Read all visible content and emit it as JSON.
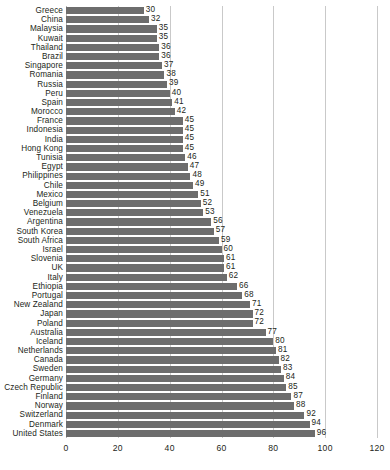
{
  "chart_data": {
    "type": "bar",
    "orientation": "horizontal",
    "title": "",
    "subtitle": "",
    "xlabel": "",
    "ylabel": "",
    "xlim": [
      0,
      120
    ],
    "ylim": null,
    "grid": true,
    "legend": null,
    "legend_position": "none",
    "xticks": [
      0,
      20,
      40,
      60,
      80,
      100,
      120
    ],
    "xtick_labels": [
      "0",
      "20",
      "40",
      "60",
      "80",
      "100",
      "120"
    ],
    "bar_color": "#6d6d6d",
    "gridline_color": "#c9c9c9",
    "value_labels": true,
    "categories": [
      "Greece",
      "China",
      "Malaysia",
      "Kuwait",
      "Thailand",
      "Brazil",
      "Singapore",
      "Romania",
      "Russia",
      "Peru",
      "Spain",
      "Morocco",
      "France",
      "Indonesia",
      "India",
      "Hong Kong",
      "Tunisia",
      "Egypt",
      "Philippines",
      "Chile",
      "Mexico",
      "Belgium",
      "Venezuela",
      "Argentina",
      "South Korea",
      "South Africa",
      "Israel",
      "Slovenia",
      "UK",
      "Italy",
      "Ethiopia",
      "Portugal",
      "New Zealand",
      "Japan",
      "Poland",
      "Australia",
      "Iceland",
      "Netherlands",
      "Canada",
      "Sweden",
      "Germany",
      "Czech Republic",
      "Finland",
      "Norway",
      "Switzerland",
      "Denmark",
      "United States"
    ],
    "values": [
      30,
      32,
      35,
      35,
      36,
      36,
      37,
      38,
      39,
      40,
      41,
      42,
      45,
      45,
      45,
      45,
      46,
      47,
      48,
      49,
      51,
      52,
      53,
      56,
      57,
      59,
      60,
      61,
      61,
      62,
      66,
      68,
      71,
      72,
      72,
      77,
      80,
      81,
      82,
      83,
      84,
      85,
      87,
      88,
      92,
      94,
      96
    ]
  }
}
